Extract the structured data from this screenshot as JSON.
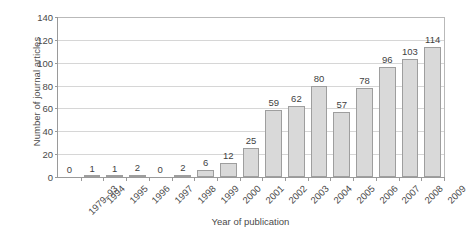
{
  "chart_data": {
    "type": "bar",
    "title": "",
    "xlabel": "Year of publication",
    "ylabel": "Number of journal articles",
    "categories": [
      "1979–93",
      "1994",
      "1995",
      "1996",
      "1997",
      "1998",
      "1999",
      "2000",
      "2001",
      "2002",
      "2003",
      "2004",
      "2005",
      "2006",
      "2007",
      "2008",
      "2009"
    ],
    "values": [
      0,
      1,
      1,
      2,
      0,
      2,
      6,
      12,
      25,
      59,
      62,
      80,
      57,
      78,
      96,
      103,
      114
    ],
    "value_labels": [
      "0",
      "1",
      "1",
      "2",
      "0",
      "2",
      "6",
      "12",
      "25",
      "59",
      "62",
      "80",
      "57",
      "78",
      "96",
      "103",
      "114"
    ],
    "ylim": [
      0,
      140
    ],
    "ytick_values": [
      0,
      20,
      40,
      60,
      80,
      100,
      120,
      140
    ],
    "ytick_labels": [
      "0",
      "20",
      "40",
      "60",
      "80",
      "100",
      "120",
      "140"
    ],
    "grid": true,
    "legend": false,
    "show_value_labels": true,
    "colors": {
      "bar_fill": "#d9d9d9",
      "bar_border": "#9e9e9e",
      "gridline": "#d6d6d6",
      "axis": "#9a9a9a",
      "text": "#4a4a4a",
      "background": "#ffffff"
    }
  }
}
